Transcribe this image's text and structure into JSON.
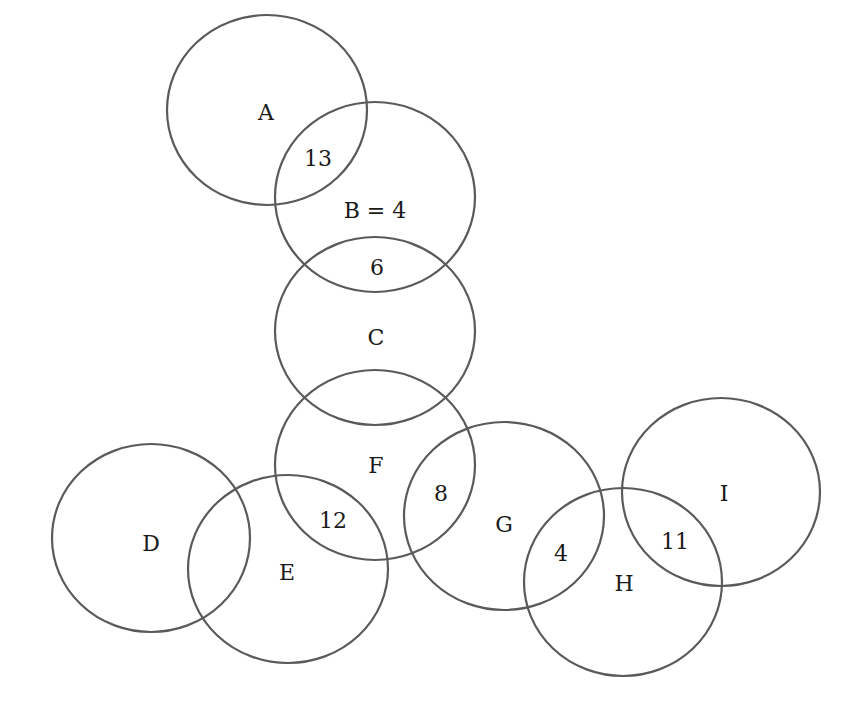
{
  "diagram": {
    "type": "overlapping-sets",
    "stroke_color": "#5a5a5a",
    "background": "#ffffff",
    "sets": [
      {
        "id": "A",
        "label": "A",
        "cx": 267,
        "cy": 110,
        "rx": 100,
        "ry": 95,
        "label_x": 266,
        "label_y": 112
      },
      {
        "id": "B",
        "label": "B = 4",
        "cx": 375,
        "cy": 197,
        "rx": 100,
        "ry": 95,
        "label_x": 375,
        "label_y": 210
      },
      {
        "id": "C",
        "label": "C",
        "cx": 375,
        "cy": 331,
        "rx": 100,
        "ry": 94,
        "label_x": 376,
        "label_y": 337
      },
      {
        "id": "F",
        "label": "F",
        "cx": 375,
        "cy": 465,
        "rx": 100,
        "ry": 95,
        "label_x": 376,
        "label_y": 465
      },
      {
        "id": "D",
        "label": "D",
        "cx": 151,
        "cy": 538,
        "rx": 99,
        "ry": 94,
        "label_x": 151,
        "label_y": 543
      },
      {
        "id": "E",
        "label": "E",
        "cx": 288,
        "cy": 569,
        "rx": 100,
        "ry": 94,
        "label_x": 287,
        "label_y": 572
      },
      {
        "id": "G",
        "label": "G",
        "cx": 504,
        "cy": 516,
        "rx": 100,
        "ry": 94,
        "label_x": 504,
        "label_y": 524
      },
      {
        "id": "H",
        "label": "H",
        "cx": 623,
        "cy": 582,
        "rx": 99,
        "ry": 94,
        "label_x": 624,
        "label_y": 583
      },
      {
        "id": "I",
        "label": "I",
        "cx": 721,
        "cy": 492,
        "rx": 99,
        "ry": 94,
        "label_x": 724,
        "label_y": 493
      }
    ],
    "intersections": [
      {
        "between": [
          "A",
          "B"
        ],
        "value": "13",
        "x": 318,
        "y": 158
      },
      {
        "between": [
          "B",
          "C"
        ],
        "value": "6",
        "x": 377,
        "y": 267
      },
      {
        "between": [
          "E",
          "F"
        ],
        "value": "12",
        "x": 333,
        "y": 520
      },
      {
        "between": [
          "F",
          "G"
        ],
        "value": "8",
        "x": 441,
        "y": 493
      },
      {
        "between": [
          "G",
          "H"
        ],
        "value": "4",
        "x": 561,
        "y": 553
      },
      {
        "between": [
          "H",
          "I"
        ],
        "value": "11",
        "x": 675,
        "y": 541
      }
    ]
  }
}
